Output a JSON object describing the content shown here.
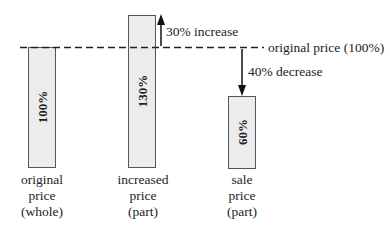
{
  "diagram": {
    "reference_line": {
      "label": "original price (100%)"
    },
    "bars": [
      {
        "value_label": "100%",
        "caption": [
          "original",
          "price",
          "(whole)"
        ]
      },
      {
        "value_label": "130%",
        "caption": [
          "increased",
          "price",
          "(part)"
        ]
      },
      {
        "value_label": "60%",
        "caption": [
          "sale",
          "price",
          "(part)"
        ]
      }
    ],
    "annotations": {
      "increase": "30% increase",
      "decrease": "40% decrease"
    }
  }
}
